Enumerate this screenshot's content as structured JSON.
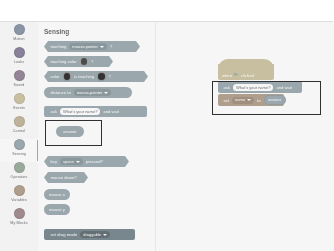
{
  "app": {
    "name": "Scratch Editor"
  },
  "sidebar": {
    "items": [
      {
        "name": "Motion",
        "color": "#4c97ff"
      },
      {
        "name": "Looks",
        "color": "#9966ff"
      },
      {
        "name": "Sound",
        "color": "#cf63cf"
      },
      {
        "name": "Events",
        "color": "#ffbf00"
      },
      {
        "name": "Control",
        "color": "#ffab19"
      },
      {
        "name": "Sensing",
        "color": "#5cb1d6"
      },
      {
        "name": "Operators",
        "color": "#59c059"
      },
      {
        "name": "Variables",
        "color": "#ff8c1a"
      },
      {
        "name": "My Blocks",
        "color": "#ff6680"
      }
    ],
    "selected": "Sensing"
  },
  "palette": {
    "title": "Sensing",
    "category_color": "#5cb1d6",
    "blocks": [
      {
        "shape": "boolean",
        "pre": "touching",
        "input": "mouse-pointer",
        "input_type": "dropdown",
        "post": "?"
      },
      {
        "shape": "boolean",
        "pre": "touching color",
        "input": "",
        "input_type": "color",
        "post": "?"
      },
      {
        "shape": "boolean",
        "pre": "color",
        "mid": "is touching",
        "input_type": "color2",
        "post": "?"
      },
      {
        "shape": "reporter",
        "pre": "distance to",
        "input": "mouse-pointer",
        "input_type": "dropdown",
        "post": ""
      },
      {
        "shape": "stack",
        "pre": "ask",
        "input": "What's your name?",
        "input_type": "text",
        "post": "and wait"
      },
      {
        "shape": "reporter",
        "pre": "answer",
        "input": "",
        "input_type": "none",
        "post": ""
      },
      {
        "shape": "boolean",
        "pre": "key",
        "input": "space",
        "input_type": "dropdown",
        "post": "pressed?"
      },
      {
        "shape": "boolean",
        "pre": "mouse down?",
        "input": "",
        "input_type": "none",
        "post": ""
      },
      {
        "shape": "reporter",
        "pre": "mouse x",
        "input": "",
        "input_type": "none",
        "post": ""
      },
      {
        "shape": "reporter",
        "pre": "mouse y",
        "input": "",
        "input_type": "none",
        "post": ""
      },
      {
        "shape": "stack-dark",
        "pre": "set drag mode",
        "input": "draggable",
        "input_type": "dropdown",
        "post": ""
      }
    ],
    "highlighted_block": "answer"
  },
  "workspace": {
    "script": {
      "hat": {
        "label": "when",
        "suffix": "clicked",
        "icon": "green-flag-icon",
        "color": "#ffbf00"
      },
      "rows": [
        {
          "kind": "sensing",
          "pre": "ask",
          "input": "What's your name?",
          "post": "and wait",
          "color": "#5cb1d6"
        },
        {
          "kind": "variable",
          "pre": "set",
          "dropdown": "name",
          "mid": "to",
          "reporter": "answer",
          "color": "#ff8c1a"
        }
      ]
    },
    "highlight_label": "selection-box"
  }
}
